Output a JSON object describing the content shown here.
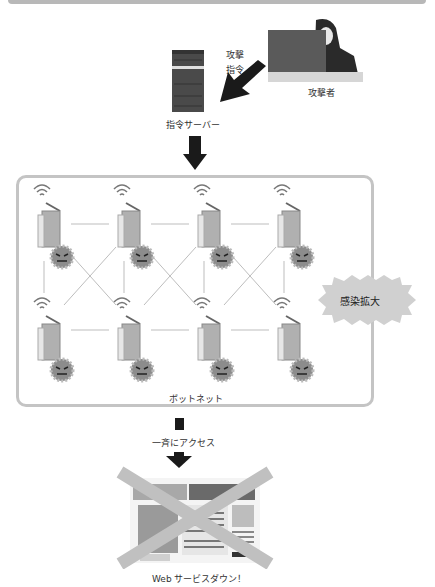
{
  "diagram": {
    "attacker": {
      "label": "攻撃者"
    },
    "command_label": [
      "攻撃",
      "指令"
    ],
    "server": {
      "label": "指令サーバー"
    },
    "botnet": {
      "label": "ボットネット",
      "rows": 2,
      "cols": 4
    },
    "spread_badge": {
      "label": "感染拡大"
    },
    "access_label": "一斉にアクセス",
    "result_label": "Web サービスダウン！"
  },
  "colors": {
    "arrow": "#1a1a1a",
    "frame": "#c4c4c4",
    "cross": "#c0c0c0",
    "badge": "#d0d0d0",
    "server": "#4a4a4a"
  }
}
